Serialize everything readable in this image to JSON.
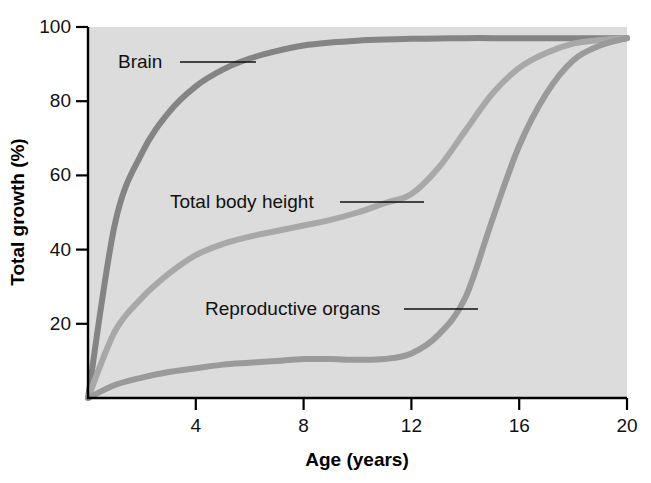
{
  "chart_data": {
    "type": "line",
    "title": "",
    "xlabel": "Age (years)",
    "ylabel": "Total growth (%)",
    "xlim": [
      0,
      20
    ],
    "ylim": [
      0,
      100
    ],
    "xticks": [
      4,
      8,
      12,
      16,
      20
    ],
    "yticks": [
      20,
      40,
      60,
      80,
      100
    ],
    "grid": false,
    "legend_position": "inline-labels",
    "plot_background_color": "#dcdcdc",
    "x": [
      0,
      1,
      2,
      3,
      4,
      5,
      6,
      7,
      8,
      9,
      10,
      11,
      12,
      13,
      14,
      15,
      16,
      17,
      18,
      19,
      20
    ],
    "series": [
      {
        "name": "Brain",
        "color": "#848484",
        "values": [
          0,
          47,
          66,
          77,
          84,
          88.5,
          91.5,
          93.5,
          95,
          95.8,
          96.3,
          96.6,
          96.8,
          96.9,
          97,
          97,
          97,
          97,
          97,
          97,
          97
        ]
      },
      {
        "name": "Total body height",
        "color": "#a8a8a8",
        "values": [
          0,
          18,
          27,
          33.5,
          38.5,
          41.5,
          43.5,
          45,
          46.5,
          48,
          50,
          52.5,
          55,
          62,
          72,
          82,
          89,
          93,
          95.5,
          96.5,
          97
        ]
      },
      {
        "name": "Reproductive organs",
        "color": "#9a9a9a",
        "values": [
          0,
          3.5,
          5.5,
          7,
          8,
          9,
          9.5,
          10,
          10.5,
          10.5,
          10.3,
          10.5,
          12,
          17,
          27,
          48,
          68,
          82,
          91,
          95,
          97
        ]
      }
    ],
    "annotations": [
      {
        "text": "Brain",
        "label_x": 118,
        "label_y": 68,
        "leader_from_x": 180,
        "leader_to_x": 256,
        "leader_y": 62
      },
      {
        "text": "Total body height",
        "label_x": 170,
        "label_y": 208,
        "leader_from_x": 340,
        "leader_to_x": 424,
        "leader_y": 202
      },
      {
        "text": "Reproductive organs",
        "label_x": 205,
        "label_y": 315,
        "leader_from_x": 404,
        "leader_to_x": 478,
        "leader_y": 309
      }
    ]
  },
  "axis": {
    "x_tick_labels": [
      "4",
      "8",
      "12",
      "16",
      "20"
    ],
    "y_tick_labels": [
      "20",
      "40",
      "60",
      "80",
      "100"
    ],
    "x_title": "Age (years)",
    "y_title": "Total growth (%)"
  }
}
